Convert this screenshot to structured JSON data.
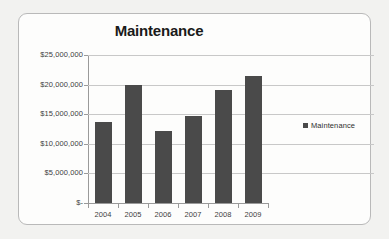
{
  "chart_data": {
    "type": "bar",
    "title": "Maintenance",
    "xlabel": "",
    "ylabel": "",
    "categories": [
      "2004",
      "2005",
      "2006",
      "2007",
      "2008",
      "2009"
    ],
    "values": [
      13700000,
      19900000,
      12200000,
      14700000,
      19100000,
      21500000
    ],
    "series": [
      {
        "name": "Maintenance",
        "values": [
          13700000,
          19900000,
          12200000,
          14700000,
          19100000,
          21500000
        ]
      }
    ],
    "ylim": [
      0,
      25000000
    ],
    "ytick_values": [
      0,
      5000000,
      10000000,
      15000000,
      20000000,
      25000000
    ],
    "ytick_labels": [
      "$-",
      "$5,000,000",
      "$10,000,000",
      "$15,000,000",
      "$20,000,000",
      "$25,000,000"
    ],
    "grid": true,
    "legend_position": "right",
    "legend_entries": [
      "Maintenance"
    ],
    "bar_color": "#4a4a4a",
    "gridline_color": "#c8c8c8",
    "axis_color": "#9a9a9a",
    "plot_background": "#fdfdfc"
  },
  "legend": {
    "label": "Maintenance",
    "swatch_icon": "square-marker-icon"
  }
}
